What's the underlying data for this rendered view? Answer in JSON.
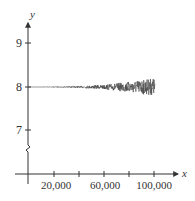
{
  "chart_data": {
    "type": "line",
    "title": "",
    "xlabel": "x",
    "ylabel": "y",
    "x_ticks": [
      20000,
      40000,
      60000,
      80000,
      100000
    ],
    "x_tick_labels": [
      "20,000",
      "",
      "60,000",
      "",
      "100,000"
    ],
    "y_ticks": [
      7,
      8,
      9
    ],
    "y_tick_labels": [
      "7",
      "8",
      "9"
    ],
    "xlim": [
      0,
      110000
    ],
    "ylim": [
      6,
      9.5
    ],
    "y_axis_break": true,
    "grid": false,
    "legend": null,
    "series": [
      {
        "name": "sequence",
        "description": "Oscillates around y = 8; amplitude grows with x (tiny near 0, about ±0.2 near 100,000)",
        "x": [
          0,
          20000,
          40000,
          60000,
          80000,
          100000
        ],
        "center": [
          8,
          8,
          8,
          8,
          8,
          8
        ],
        "approx_amplitude": [
          0.0,
          0.005,
          0.02,
          0.05,
          0.12,
          0.2
        ]
      }
    ],
    "colors": {
      "axis": "#333333",
      "line": "#444444"
    }
  }
}
